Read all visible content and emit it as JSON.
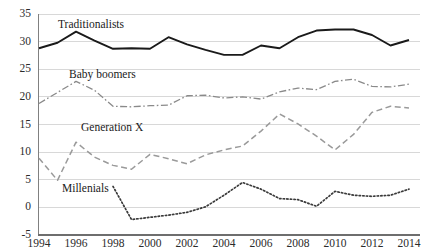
{
  "chart_data": {
    "type": "line",
    "title": "",
    "xlabel": "",
    "ylabel": "",
    "xlim": [
      1994,
      2014
    ],
    "ylim": [
      -5,
      35
    ],
    "grid": true,
    "legend_position": "inline-labels",
    "y_ticks": [
      35,
      30,
      25,
      20,
      15,
      10,
      5,
      0,
      -5
    ],
    "x_ticks": [
      1994,
      1996,
      1998,
      2000,
      2002,
      2004,
      2006,
      2008,
      2010,
      2012,
      2014
    ],
    "x": [
      1994,
      1995,
      1996,
      1997,
      1998,
      1999,
      2000,
      2001,
      2002,
      2003,
      2004,
      2005,
      2006,
      2007,
      2008,
      2009,
      2010,
      2011,
      2012,
      2013,
      2014
    ],
    "series": [
      {
        "name": "Traditionalists",
        "style": "solid",
        "color": "#1a1a1a",
        "values": [
          28.8,
          29.8,
          31.8,
          30.2,
          28.7,
          28.8,
          28.7,
          30.8,
          29.5,
          28.5,
          27.6,
          27.6,
          29.3,
          28.8,
          30.8,
          32.0,
          32.2,
          32.2,
          31.2,
          29.3,
          30.3
        ]
      },
      {
        "name": "Baby boomers",
        "style": "dash-dot",
        "color": "#8a8a8a",
        "values": [
          18.8,
          20.8,
          22.8,
          21.2,
          18.3,
          18.2,
          18.4,
          18.5,
          20.2,
          20.3,
          19.8,
          20.0,
          19.6,
          20.9,
          21.6,
          21.3,
          22.8,
          23.2,
          21.9,
          21.8,
          22.3
        ]
      },
      {
        "name": "Generation X",
        "style": "dashed",
        "color": "#9a9a9a",
        "values": [
          8.9,
          4.9,
          11.8,
          9.1,
          7.6,
          6.9,
          9.6,
          8.8,
          7.9,
          9.5,
          10.4,
          11.1,
          13.8,
          16.9,
          15.1,
          12.9,
          10.4,
          13.2,
          17.2,
          18.3,
          18.0
        ]
      },
      {
        "name": "Millenials",
        "style": "dotted",
        "color": "#3a3a3a",
        "values": [
          null,
          null,
          null,
          null,
          3.8,
          -2.2,
          -1.8,
          -1.4,
          -0.9,
          0.1,
          2.2,
          4.5,
          3.3,
          1.6,
          1.4,
          0.2,
          2.9,
          2.2,
          2.0,
          2.2,
          3.3
        ]
      }
    ],
    "series_label_positions": [
      {
        "name": "Traditionalists",
        "x": 58,
        "y": 18
      },
      {
        "name": "Baby boomers",
        "x": 69,
        "y": 68
      },
      {
        "name": "Generation X",
        "x": 81,
        "y": 121
      },
      {
        "name": "Millenials",
        "x": 62,
        "y": 182
      }
    ]
  },
  "axes": {
    "y_tick_labels": [
      "35",
      "30",
      "25",
      "20",
      "15",
      "10",
      "5",
      "0",
      "-5"
    ],
    "x_tick_labels": [
      "1994",
      "1996",
      "1998",
      "2000",
      "2002",
      "2004",
      "2006",
      "2008",
      "2010",
      "2012",
      "2014"
    ]
  },
  "colors": {
    "background": "#ffffff",
    "grid": "#d8d8d8",
    "axis": "#808080",
    "text": "#2b2b2b",
    "traditionalists": "#1a1a1a",
    "baby_boomers": "#8a8a8a",
    "generation_x": "#9a9a9a",
    "millenials": "#3a3a3a"
  }
}
